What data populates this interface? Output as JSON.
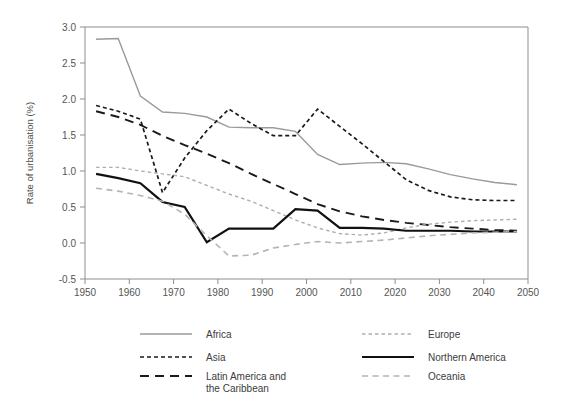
{
  "chart_data": {
    "type": "line",
    "title": "",
    "xlabel": "",
    "ylabel": "Rate of urbanisation (%)",
    "xlim": [
      1950,
      2050
    ],
    "ylim": [
      -0.5,
      3.0
    ],
    "xticks": [
      1950,
      1960,
      1970,
      1980,
      1990,
      2000,
      2010,
      2020,
      2030,
      2040,
      2050
    ],
    "yticks": [
      "-0.5",
      "0.0",
      "0.5",
      "1.0",
      "1.5",
      "2.0",
      "2.5",
      "3.0"
    ],
    "grid": false,
    "legend_position": "bottom",
    "x": [
      1952.5,
      1957.5,
      1962.5,
      1967.5,
      1972.5,
      1977.5,
      1982.5,
      1987.5,
      1992.5,
      1997.5,
      2002.5,
      2007.5,
      2012.5,
      2017.5,
      2022.5,
      2027.5,
      2032.5,
      2037.5,
      2042.5,
      2047.5
    ],
    "series": [
      {
        "name": "Africa",
        "color": "#9a9a9a",
        "style": "solid",
        "width": 1.4,
        "values": [
          2.83,
          2.84,
          2.04,
          1.82,
          1.8,
          1.75,
          1.61,
          1.6,
          1.6,
          1.55,
          1.23,
          1.09,
          1.11,
          1.12,
          1.1,
          1.03,
          0.95,
          0.89,
          0.84,
          0.81
        ]
      },
      {
        "name": "Asia",
        "color": "#1a1a1a",
        "style": "dotted-dash",
        "width": 1.7,
        "values": [
          1.91,
          1.83,
          1.72,
          0.7,
          1.18,
          1.56,
          1.86,
          1.66,
          1.49,
          1.49,
          1.86,
          1.62,
          1.38,
          1.13,
          0.88,
          0.73,
          0.64,
          0.6,
          0.59,
          0.59
        ]
      },
      {
        "name": "Latin America and\nthe Caribbean",
        "color": "#1a1a1a",
        "style": "long-dash",
        "width": 1.9,
        "values": [
          1.83,
          1.75,
          1.64,
          1.49,
          1.36,
          1.24,
          1.11,
          0.96,
          0.82,
          0.68,
          0.54,
          0.44,
          0.37,
          0.32,
          0.28,
          0.25,
          0.22,
          0.2,
          0.18,
          0.17
        ]
      },
      {
        "name": "Europe",
        "color": "#aeaeae",
        "style": "fine-dash",
        "width": 1.4,
        "values": [
          1.05,
          1.05,
          1.0,
          0.96,
          0.92,
          0.8,
          0.68,
          0.58,
          0.45,
          0.32,
          0.21,
          0.13,
          0.11,
          0.14,
          0.21,
          0.26,
          0.29,
          0.31,
          0.32,
          0.33
        ]
      },
      {
        "name": "Northern America",
        "color": "#111111",
        "style": "solid",
        "width": 2.2,
        "values": [
          0.96,
          0.9,
          0.83,
          0.57,
          0.5,
          0.01,
          0.2,
          0.2,
          0.2,
          0.47,
          0.45,
          0.21,
          0.21,
          0.2,
          0.17,
          0.17,
          0.17,
          0.16,
          0.16,
          0.16
        ]
      },
      {
        "name": "Oceania",
        "color": "#b4b4b4",
        "style": "med-dash",
        "width": 1.6,
        "values": [
          0.76,
          0.72,
          0.66,
          0.58,
          0.4,
          0.1,
          -0.18,
          -0.17,
          -0.07,
          -0.02,
          0.02,
          0.0,
          0.02,
          0.04,
          0.07,
          0.1,
          0.12,
          0.14,
          0.15,
          0.16
        ]
      }
    ],
    "legend": [
      {
        "label": "Africa",
        "column": 0,
        "row": 0
      },
      {
        "label": "Asia",
        "column": 0,
        "row": 1
      },
      {
        "label": "Latin America and",
        "label2": "the Caribbean",
        "column": 0,
        "row": 2
      },
      {
        "label": "Europe",
        "column": 1,
        "row": 0
      },
      {
        "label": "Northern America",
        "column": 1,
        "row": 1
      },
      {
        "label": "Oceania",
        "column": 1,
        "row": 2
      }
    ]
  }
}
